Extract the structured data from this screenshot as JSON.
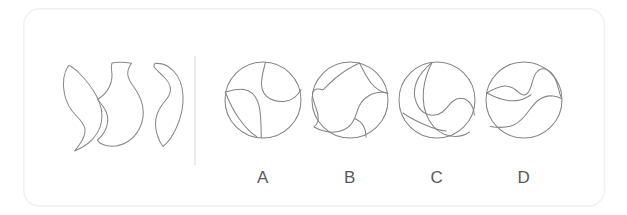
{
  "figure": {
    "type": "visual-reasoning-puzzle",
    "format": "shape-assembly-multiple-choice",
    "background_color": "#ffffff",
    "line_color": "#85858a",
    "card": {
      "x": 23,
      "y": 8,
      "width": 582,
      "height": 199,
      "corner_radius": 16,
      "border_color": "#f0f0f1",
      "fill_color": "#ffffff"
    },
    "divider": {
      "name": "vertical-divider",
      "x": 195,
      "y_top": 56,
      "y_bottom": 165,
      "color": "#e2e2e4"
    }
  },
  "prompt_panel": {
    "name": "puzzle-pieces-panel",
    "pieces": [
      {
        "id": "piece-1",
        "name": "crescent-leaf-piece",
        "description": "tall crescent with pointed lower tip, concave right edge",
        "center_x": 81,
        "center_y": 104
      },
      {
        "id": "piece-2",
        "name": "vase-piece",
        "description": "amphora silhouette with narrow flared neck, wavy left side and rounded base",
        "center_x": 122,
        "center_y": 105
      },
      {
        "id": "piece-3",
        "name": "s-curve-piece",
        "description": "backward C / S-curve band, open toward the left",
        "center_x": 166,
        "center_y": 102
      }
    ]
  },
  "options_panel": {
    "name": "answer-options-panel",
    "options": [
      {
        "id": "option-a",
        "label": "A",
        "circle": {
          "cx": 263,
          "cy": 100,
          "r": 38
        },
        "label_x": 263,
        "label_y": 183,
        "regions": 3,
        "description": "vertical wavy split from top to bottom plus an S-curve sweeping from left edge to right edge"
      },
      {
        "id": "option-b",
        "label": "B",
        "circle": {
          "cx": 350,
          "cy": 100,
          "r": 38
        },
        "label_x": 350,
        "label_y": 183,
        "regions": 3,
        "description": "hook shape at left, large lobe filling upper-right, short curve to lower edge"
      },
      {
        "id": "option-c",
        "label": "C",
        "circle": {
          "cx": 437,
          "cy": 100,
          "r": 38
        },
        "label_x": 437,
        "label_y": 183,
        "regions": 3,
        "description": "curve descending from top then sweeping right to the lower-right edge"
      },
      {
        "id": "option-d",
        "label": "D",
        "circle": {
          "cx": 524,
          "cy": 100,
          "r": 38
        },
        "label_x": 524,
        "label_y": 183,
        "regions": 3,
        "description": "two roughly horizontal wavy curves dividing the circle into three bands"
      }
    ]
  }
}
